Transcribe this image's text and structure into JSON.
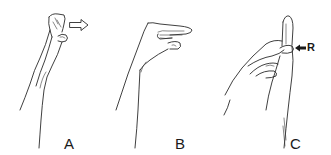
{
  "figure": {
    "panels": [
      {
        "id": "A",
        "label": "A",
        "annotation": {
          "type": "hollow-arrow",
          "direction": "right"
        }
      },
      {
        "id": "B",
        "label": "B",
        "annotation": null
      },
      {
        "id": "C",
        "label": "C",
        "annotation": {
          "type": "solid-arrow",
          "direction": "left",
          "text": "R"
        }
      }
    ],
    "colors": {
      "background": "#ffffff",
      "line": "#2a2a2a",
      "text": "#1a1a1a"
    }
  }
}
